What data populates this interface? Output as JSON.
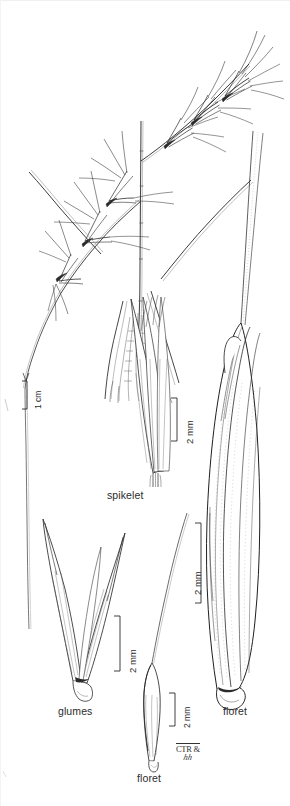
{
  "plate": {
    "type": "botanical-line-drawing",
    "subject": "grass inflorescence and floral parts",
    "background_color": "#ffffff",
    "ink_color": "#1a1a1a",
    "width": 290,
    "height": 806
  },
  "figures": [
    {
      "id": "habit",
      "label": "",
      "scale_bar": {
        "text": "1 cm",
        "orientation": "vertical",
        "length_px": 28
      }
    },
    {
      "id": "spikelet",
      "label": "spikelet",
      "scale_bar": {
        "text": "2 mm",
        "orientation": "vertical",
        "length_px": 43
      }
    },
    {
      "id": "glumes",
      "label": "glumes",
      "scale_bar": {
        "text": "2 mm",
        "orientation": "vertical",
        "length_px": 55
      }
    },
    {
      "id": "floret-small",
      "label": "floret",
      "scale_bar": {
        "text": "2 mm",
        "orientation": "vertical",
        "length_px": 33
      }
    },
    {
      "id": "floret-large",
      "label": "floret",
      "scale_bar": {
        "text": "2 mm",
        "orientation": "vertical",
        "length_px": 80
      }
    }
  ],
  "labels": {
    "spikelet": "spikelet",
    "glumes": "glumes",
    "floret_small": "floret",
    "floret_large": "floret"
  },
  "scales": {
    "habit": "1 cm",
    "spikelet": "2 mm",
    "glumes": "2 mm",
    "floret_small": "2 mm",
    "floret_large": "2 mm"
  },
  "signature": {
    "line1": "CTR &",
    "line2": "hh"
  }
}
